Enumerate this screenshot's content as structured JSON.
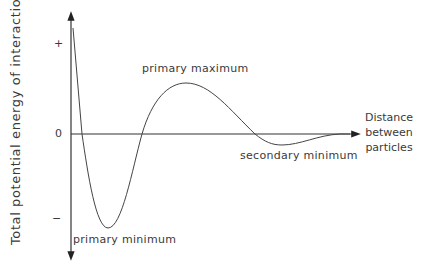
{
  "diagram": {
    "type": "potential-energy-curve",
    "y_axis_label": "Total potential energy of interaction",
    "x_axis_label_lines": [
      "Distance",
      "between",
      "particles"
    ],
    "y_ticks": {
      "plus": "+",
      "zero": "0",
      "minus": "−"
    },
    "annotations": {
      "primary_maximum": "primary maximum",
      "secondary_minimum": "secondary minimum",
      "primary_minimum": "primary minimum"
    },
    "line_color": "#333333"
  }
}
